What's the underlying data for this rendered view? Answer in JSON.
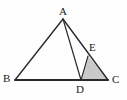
{
  "figure": {
    "canvas": {
      "width": 127,
      "height": 100
    },
    "background_color": "#fefefe",
    "stroke_color": "#2b2b2b",
    "shade_color": "#c9c9c9",
    "shade_stroke_color": "#2b2b2b"
  },
  "points": [
    {
      "id": "A",
      "label": "A",
      "x": 63,
      "y": 19,
      "label_x": 59,
      "label_y": 6
    },
    {
      "id": "B",
      "label": "B",
      "x": 15,
      "y": 80,
      "label_x": 3,
      "label_y": 73
    },
    {
      "id": "C",
      "label": "C",
      "x": 108,
      "y": 80,
      "label_x": 112,
      "label_y": 74
    },
    {
      "id": "D",
      "label": "D",
      "x": 81,
      "y": 80,
      "label_x": 76,
      "label_y": 84
    },
    {
      "id": "E",
      "label": "E",
      "x": 88,
      "y": 56,
      "label_x": 89,
      "label_y": 42
    }
  ],
  "segments": [
    {
      "id": "AB",
      "from": "A",
      "to": "B",
      "x1": 63,
      "y1": 19,
      "x2": 15,
      "y2": 80,
      "width": 1.4
    },
    {
      "id": "BC",
      "from": "B",
      "to": "C",
      "x1": 15,
      "y1": 80,
      "x2": 108,
      "y2": 80,
      "width": 1.8
    },
    {
      "id": "AC",
      "from": "A",
      "to": "C",
      "x1": 63,
      "y1": 19,
      "x2": 108,
      "y2": 80,
      "width": 1.4
    },
    {
      "id": "AD",
      "from": "A",
      "to": "D",
      "x1": 63,
      "y1": 19,
      "x2": 81,
      "y2": 80,
      "width": 1.2
    }
  ],
  "shaded_regions": [
    {
      "id": "DEC",
      "vertices": [
        "D",
        "E",
        "C"
      ],
      "polygon_points": "81,80 88,56 108,80",
      "fill": "#c9c9c9"
    }
  ]
}
